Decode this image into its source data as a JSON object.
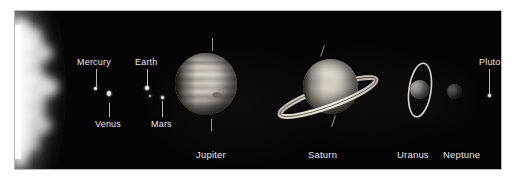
{
  "figure": {
    "caption": "",
    "background_color": "#ffffff",
    "plate_color": "#050505",
    "plate_border_color": "#b9b9b9",
    "label_color": "#e8e8e8"
  },
  "labels": {
    "mercury": "Mercury",
    "venus": "Venus",
    "earth": "Earth",
    "mars": "Mars",
    "jupiter": "Jupiter",
    "saturn": "Saturn",
    "uranus": "Uranus",
    "neptune": "Neptune",
    "pluto": "Pluto"
  },
  "bodies": [
    {
      "name": "sun",
      "label": "",
      "kind": "limb",
      "rings": false
    },
    {
      "name": "mercury",
      "label": "Mercury",
      "kind": "point",
      "rings": false
    },
    {
      "name": "venus",
      "label": "Venus",
      "kind": "point",
      "rings": false
    },
    {
      "name": "earth",
      "label": "Earth",
      "kind": "point",
      "rings": false
    },
    {
      "name": "mars",
      "label": "Mars",
      "kind": "point",
      "rings": false
    },
    {
      "name": "jupiter",
      "label": "Jupiter",
      "kind": "disc",
      "rings": false
    },
    {
      "name": "saturn",
      "label": "Saturn",
      "kind": "disc",
      "rings": true
    },
    {
      "name": "uranus",
      "label": "Uranus",
      "kind": "disc",
      "rings": true
    },
    {
      "name": "neptune",
      "label": "Neptune",
      "kind": "disc",
      "rings": false
    },
    {
      "name": "pluto",
      "label": "Pluto",
      "kind": "point",
      "rings": false
    }
  ]
}
